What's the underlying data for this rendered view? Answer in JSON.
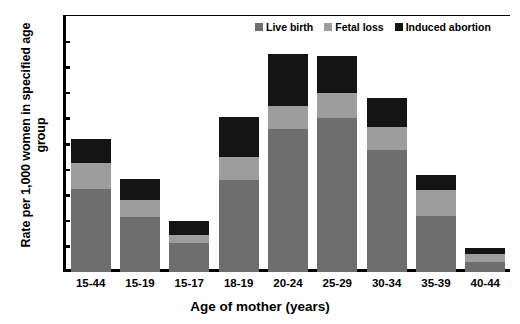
{
  "chart_data": {
    "type": "bar",
    "subtype": "stacked-vertical-bar",
    "title": "",
    "xlabel": "Age of mother (years)",
    "ylabel": "Rate per 1,000 women in specified age group",
    "categories": [
      "15-44",
      "15-19",
      "15-17",
      "18-19",
      "20-24",
      "25-29",
      "30-34",
      "35-39",
      "40-44"
    ],
    "series": [
      {
        "name": "Live birth",
        "color": "#6e6e6e",
        "values": [
          65,
          43,
          23,
          72,
          112,
          120,
          95,
          44,
          8
        ]
      },
      {
        "name": "Fetal loss",
        "color": "#9d9d9d",
        "values": [
          20,
          13,
          6,
          18,
          18,
          20,
          18,
          20,
          6
        ]
      },
      {
        "name": "Induced abortion",
        "color": "#141414",
        "values": [
          19,
          17,
          11,
          31,
          40,
          29,
          23,
          12,
          5
        ]
      }
    ],
    "totals": [
      104,
      73,
      40,
      121,
      170,
      169,
      136,
      76,
      19
    ],
    "ylim": [
      0,
      200
    ],
    "yticks": [
      0,
      20,
      40,
      60,
      80,
      100,
      120,
      140,
      160,
      180,
      200
    ],
    "ytick_labels": [
      "0",
      "20",
      "40",
      "60",
      "80",
      "100",
      "120",
      "140",
      "160",
      "180",
      "200"
    ],
    "grid": false,
    "legend_position": "top-right-inside",
    "stack_order_bottom_to_top": [
      "Live birth",
      "Fetal loss",
      "Induced abortion"
    ]
  },
  "axes": {
    "y_title": "Rate per 1,000 women in specified age group",
    "x_title": "Age of mother (years)"
  },
  "legend": {
    "items": [
      {
        "label": "Live birth",
        "color": "#6e6e6e"
      },
      {
        "label": "Fetal loss",
        "color": "#9d9d9d"
      },
      {
        "label": "Induced abortion",
        "color": "#141414"
      }
    ]
  }
}
